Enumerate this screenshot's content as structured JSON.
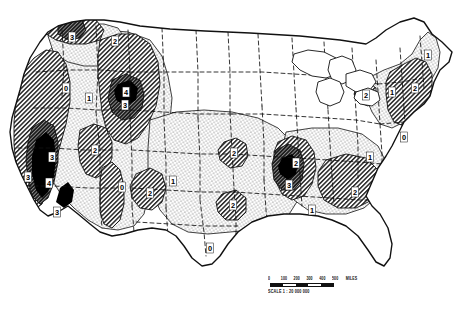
{
  "figure": {
    "kind": "isopleth-map",
    "region": "United States (conterminous)"
  },
  "scale": {
    "caption": "SCALE 1 : 20 000 000",
    "unit_label": "MILES",
    "ticks": [
      "0",
      "100",
      "200",
      "300",
      "400",
      "500"
    ],
    "segments": 5
  },
  "legend_classes": [
    {
      "value": "0",
      "fill": "white",
      "label": "0"
    },
    {
      "value": "1",
      "fill": "stipple",
      "label": "1"
    },
    {
      "value": "2",
      "fill": "hatch",
      "label": "2"
    },
    {
      "value": "3",
      "fill": "dense",
      "label": "3"
    },
    {
      "value": "4",
      "fill": "solid",
      "label": "4"
    }
  ],
  "chart_data": {
    "type": "heatmap",
    "title": "",
    "xlabel": "",
    "ylabel": "",
    "grid": false,
    "legend_position": "none",
    "contour_levels": [
      0,
      1,
      2,
      3,
      4
    ],
    "contour_labels": [
      {
        "id": "nw-pacific-3",
        "value": "3",
        "x": 72,
        "y": 37
      },
      {
        "id": "nw-pacific-2",
        "value": "2",
        "x": 115,
        "y": 41
      },
      {
        "id": "columbia-0",
        "value": "0",
        "x": 66,
        "y": 88
      },
      {
        "id": "rockies-mt-4",
        "value": "4",
        "x": 126,
        "y": 92
      },
      {
        "id": "rockies-mt-3",
        "value": "3",
        "x": 125,
        "y": 105
      },
      {
        "id": "idaho-1",
        "value": "1",
        "x": 89,
        "y": 98
      },
      {
        "id": "sierra-3",
        "value": "3",
        "x": 52,
        "y": 157
      },
      {
        "id": "sierra-4",
        "value": "4",
        "x": 49,
        "y": 183
      },
      {
        "id": "socal-3",
        "value": "3",
        "x": 28,
        "y": 177
      },
      {
        "id": "socal-edge-3",
        "value": "3",
        "x": 57,
        "y": 212
      },
      {
        "id": "greatbasin-2",
        "value": "2",
        "x": 95,
        "y": 150
      },
      {
        "id": "colo-plateau-0",
        "value": "0",
        "x": 122,
        "y": 187
      },
      {
        "id": "rockies-co-2",
        "value": "2",
        "x": 150,
        "y": 193
      },
      {
        "id": "kansas-1",
        "value": "1",
        "x": 173,
        "y": 181
      },
      {
        "id": "ozark-2",
        "value": "2",
        "x": 234,
        "y": 153
      },
      {
        "id": "texas-2",
        "value": "2",
        "x": 233,
        "y": 205
      },
      {
        "id": "texas-0",
        "value": "0",
        "x": 210,
        "y": 248
      },
      {
        "id": "tennessee-2",
        "value": "2",
        "x": 296,
        "y": 163
      },
      {
        "id": "appalach-3",
        "value": "3",
        "x": 289,
        "y": 185
      },
      {
        "id": "gulf-1",
        "value": "1",
        "x": 312,
        "y": 210
      },
      {
        "id": "southeast-2",
        "value": "2",
        "x": 355,
        "y": 192
      },
      {
        "id": "carolina-1",
        "value": "1",
        "x": 370,
        "y": 157
      },
      {
        "id": "midatl-0",
        "value": "0",
        "x": 404,
        "y": 137
      },
      {
        "id": "newengland-2",
        "value": "2",
        "x": 415,
        "y": 88
      },
      {
        "id": "maine-1",
        "value": "1",
        "x": 428,
        "y": 55
      },
      {
        "id": "nystate-1",
        "value": "1",
        "x": 392,
        "y": 92
      },
      {
        "id": "greatlakes-2",
        "value": "2",
        "x": 366,
        "y": 95
      }
    ]
  },
  "colors": {
    "ink": "#111111",
    "paper": "#ffffff",
    "hatch": "#2a2a2a",
    "stipple": "#3a3a3a",
    "solid": "#000000"
  }
}
